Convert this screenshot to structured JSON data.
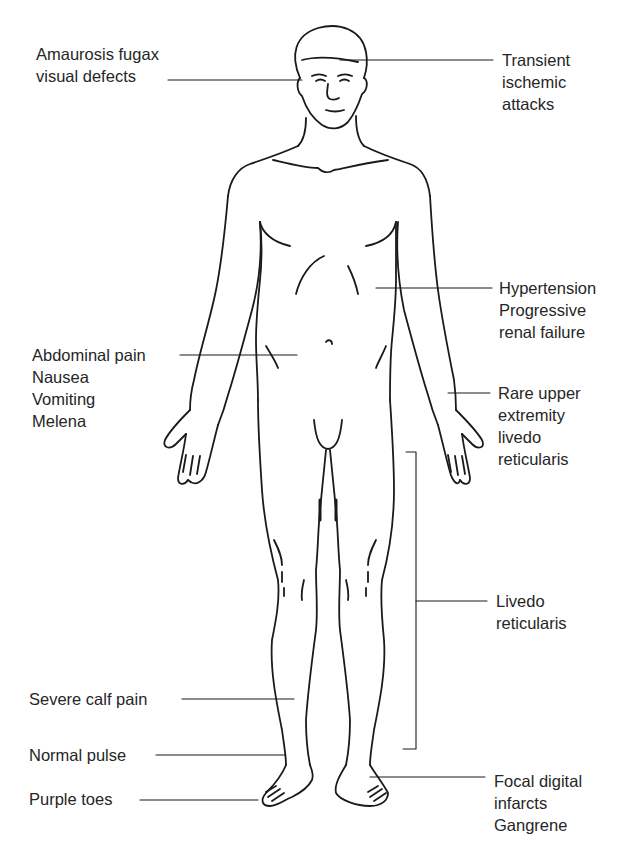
{
  "diagram": {
    "type": "anatomical-figure",
    "labels_left": [
      {
        "id": "amaurosis",
        "lines": [
          "Amaurosis fugax",
          "visual defects"
        ]
      },
      {
        "id": "abdominal",
        "lines": [
          "Abdominal pain",
          "Nausea",
          "Vomiting",
          "Melena"
        ]
      },
      {
        "id": "calf",
        "lines": [
          "Severe calf pain"
        ]
      },
      {
        "id": "pulse",
        "lines": [
          "Normal pulse"
        ]
      },
      {
        "id": "toes",
        "lines": [
          "Purple toes"
        ]
      }
    ],
    "labels_right": [
      {
        "id": "tia",
        "lines": [
          "Transient",
          "ischemic",
          "attacks"
        ]
      },
      {
        "id": "renal",
        "lines": [
          "Hypertension",
          "Progressive",
          "renal failure"
        ]
      },
      {
        "id": "upper-livedo",
        "lines": [
          "Rare upper",
          "extremity",
          "livedo",
          "reticularis"
        ]
      },
      {
        "id": "livedo",
        "lines": [
          "Livedo",
          "reticularis"
        ]
      },
      {
        "id": "digital",
        "lines": [
          "Focal digital",
          "infarcts",
          "Gangrene"
        ]
      }
    ],
    "colors": {
      "line": "#1a1a1a",
      "text": "#262626",
      "background": "#ffffff"
    }
  }
}
